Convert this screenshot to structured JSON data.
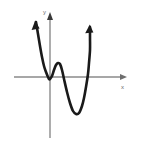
{
  "figure": {
    "background_color": "#ffffff",
    "width": 142,
    "height": 147
  },
  "axes": {
    "x_axis": {
      "label": "x",
      "color": "#8a8a8a",
      "start_x": 14,
      "end_x": 127,
      "y": 77,
      "arrow": "right"
    },
    "y_axis": {
      "label": "y",
      "color": "#8a8a8a",
      "x": 50,
      "start_y": 138,
      "end_y": 13,
      "arrow": "up"
    },
    "origin": {
      "x": 50,
      "y": 77
    }
  },
  "curve": {
    "color": "#1a1a1a",
    "stroke_width": 2.6,
    "arrow_left_label": "up-arrow-left-branch",
    "arrow_right_label": "up-arrow-right-branch",
    "description": "W-shaped quartic with two local minima and one local maximum"
  },
  "chart_data": {
    "type": "line",
    "xlabel": "x",
    "ylabel": "y",
    "grid": false,
    "legend": null,
    "xlim": [
      14,
      127
    ],
    "ylim": [
      138,
      13
    ],
    "series": [
      {
        "name": "quartic curve",
        "points_px": [
          [
            36,
            22
          ],
          [
            38,
            34
          ],
          [
            40,
            46
          ],
          [
            42,
            57
          ],
          [
            44,
            66
          ],
          [
            46,
            72
          ],
          [
            48,
            77
          ],
          [
            49,
            79
          ],
          [
            50,
            79
          ],
          [
            52,
            76
          ],
          [
            54,
            70
          ],
          [
            56,
            65
          ],
          [
            58,
            63
          ],
          [
            60,
            64
          ],
          [
            62,
            70
          ],
          [
            64,
            79
          ],
          [
            67,
            92
          ],
          [
            70,
            103
          ],
          [
            73,
            111
          ],
          [
            76,
            114
          ],
          [
            79,
            113
          ],
          [
            82,
            106
          ],
          [
            84,
            98
          ],
          [
            86,
            87
          ],
          [
            88,
            74
          ],
          [
            89,
            63
          ],
          [
            90,
            50
          ],
          [
            90,
            38
          ],
          [
            90,
            27
          ]
        ],
        "features": {
          "local_minimum_1": [
            49,
            79
          ],
          "local_maximum": [
            58,
            63
          ],
          "local_minimum_2": [
            76,
            114
          ],
          "x_intercepts_px": [
            46,
            51,
            63,
            87
          ],
          "end_behavior": "both ends rise to +infinity"
        }
      }
    ]
  }
}
